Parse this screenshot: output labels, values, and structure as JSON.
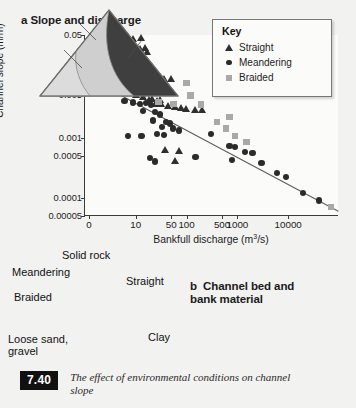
{
  "panel_a": {
    "title": "a  Slope and discharge",
    "legend": {
      "title": "Key",
      "items": [
        {
          "label": "Straight",
          "marker": "triangle-marker-icon"
        },
        {
          "label": "Meandering",
          "marker": "circle-marker-icon"
        },
        {
          "label": "Braided",
          "marker": "square-marker-icon"
        }
      ]
    }
  },
  "panel_b": {
    "title": "b  Channel bed and bank material",
    "apex_labels": {
      "top": "Solid rock",
      "bottom_left": "Loose sand, gravel",
      "bottom_right": "Clay"
    },
    "regions": [
      {
        "label": "Meandering",
        "color": "#cfcfcf"
      },
      {
        "label": "Braided",
        "color": "#dedede"
      },
      {
        "label": "Straight",
        "color": "#3f3f3f"
      }
    ]
  },
  "caption": {
    "number": "7.40",
    "text": "The effect of environmental conditions on channel slope"
  },
  "chart_data": {
    "type": "scatter",
    "title": "a  Slope and discharge",
    "xlabel": "Bankfull discharge (m3/s)",
    "ylabel": "Channel slope (m/m)",
    "xscale": "log",
    "yscale": "log",
    "xticklabels": [
      "0",
      "10",
      "50",
      "100",
      "500",
      "1000",
      "10000"
    ],
    "yticklabels": [
      "0.05",
      "0.01",
      "0.005",
      "0.001",
      "0.0005",
      "0.0001",
      "0.00005"
    ],
    "xlim": [
      1,
      100000
    ],
    "ylim": [
      5e-05,
      0.05
    ],
    "grid": false,
    "legend_position": "top-right",
    "series": [
      {
        "name": "Straight",
        "marker": "triangle",
        "color": "#2f2f2f",
        "points": [
          [
            9,
            0.043
          ],
          [
            13,
            0.046
          ],
          [
            7.5,
            0.037
          ],
          [
            12,
            0.03
          ],
          [
            15,
            0.031
          ],
          [
            17,
            0.026
          ],
          [
            4.5,
            0.0115
          ],
          [
            11,
            0.0105
          ],
          [
            36,
            0.0095
          ],
          [
            50,
            0.0095
          ],
          [
            10,
            0.0052
          ],
          [
            14,
            0.0048
          ],
          [
            18,
            0.0043
          ],
          [
            21,
            0.0044
          ],
          [
            26,
            0.004
          ],
          [
            32,
            0.0037
          ],
          [
            44,
            0.0034
          ],
          [
            60,
            0.0033
          ],
          [
            80,
            0.0031
          ],
          [
            100,
            0.003
          ],
          [
            150,
            0.0029
          ],
          [
            38,
            0.00062
          ],
          [
            70,
            0.0006
          ],
          [
            60,
            0.00042
          ],
          [
            200,
            0.0029
          ],
          [
            25,
            0.0036
          ],
          [
            30,
            0.0042
          ]
        ]
      },
      {
        "name": "Meandering",
        "marker": "circle",
        "color": "#2b2b2b",
        "points": [
          [
            8,
            0.0098
          ],
          [
            6,
            0.004
          ],
          [
            9,
            0.0038
          ],
          [
            12,
            0.0036
          ],
          [
            16,
            0.0037
          ],
          [
            20,
            0.0034
          ],
          [
            14,
            0.0027
          ],
          [
            24,
            0.0026
          ],
          [
            30,
            0.0024
          ],
          [
            22,
            0.0019
          ],
          [
            40,
            0.0018
          ],
          [
            33,
            0.0015
          ],
          [
            48,
            0.0017
          ],
          [
            55,
            0.0014
          ],
          [
            7,
            0.00105
          ],
          [
            13,
            0.00105
          ],
          [
            26,
            0.00115
          ],
          [
            36,
            0.0011
          ],
          [
            70,
            0.0013
          ],
          [
            19,
            0.00045
          ],
          [
            24,
            0.0004
          ],
          [
            300,
            0.00115
          ],
          [
            700,
            0.00072
          ],
          [
            900,
            0.0007
          ],
          [
            1400,
            0.00058
          ],
          [
            800,
            0.00042
          ],
          [
            2000,
            0.00055
          ],
          [
            3000,
            0.00038
          ],
          [
            6000,
            0.00026
          ],
          [
            9000,
            0.00022
          ],
          [
            20000,
            0.00012
          ],
          [
            40000,
            9e-05
          ],
          [
            150,
            0.00048
          ]
        ]
      },
      {
        "name": "Braided",
        "marker": "square",
        "color": "#a9a9a9",
        "points": [
          [
            22,
            0.0073
          ],
          [
            30,
            0.0055
          ],
          [
            28,
            0.0039
          ],
          [
            55,
            0.0036
          ],
          [
            100,
            0.008
          ],
          [
            120,
            0.005
          ],
          [
            190,
            0.0035
          ],
          [
            400,
            0.0018
          ],
          [
            600,
            0.0014
          ],
          [
            900,
            0.00105
          ],
          [
            700,
            0.0022
          ],
          [
            1500,
            0.00085
          ],
          [
            70000,
            7e-05
          ]
        ]
      }
    ],
    "trendline": {
      "from": [
        1.6,
        0.0088
      ],
      "to": [
        100000,
        6.2e-05
      ]
    }
  }
}
